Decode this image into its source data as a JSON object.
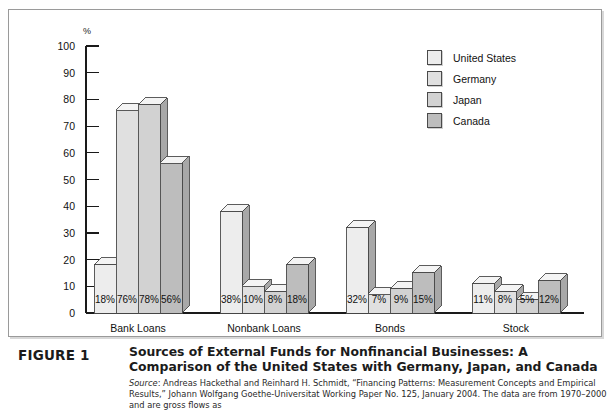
{
  "chart_data": {
    "type": "bar",
    "title": "",
    "xlabel": "",
    "ylabel": "%",
    "ylim": [
      0,
      100
    ],
    "yticks": [
      100,
      90,
      80,
      70,
      60,
      50,
      40,
      30,
      20,
      10,
      0
    ],
    "grid": false,
    "legend_position": "top-right",
    "categories": [
      "Bank Loans",
      "Nonbank Loans",
      "Bonds",
      "Stock"
    ],
    "series": [
      {
        "name": "United States",
        "color": "#ededed",
        "values": [
          18,
          38,
          32,
          11
        ],
        "labels": [
          "18%",
          "38%",
          "32%",
          "11%"
        ]
      },
      {
        "name": "Germany",
        "color": "#e0e0e0",
        "values": [
          76,
          10,
          7,
          8
        ],
        "labels": [
          "76%",
          "10%",
          "7%",
          "8%"
        ]
      },
      {
        "name": "Japan",
        "color": "#d2d2d2",
        "values": [
          78,
          8,
          9,
          5
        ],
        "labels": [
          "78%",
          "8%",
          "9%",
          "5%"
        ]
      },
      {
        "name": "Canada",
        "color": "#bdbdbd",
        "values": [
          56,
          18,
          15,
          12
        ],
        "labels": [
          "56%",
          "18%",
          "15%",
          "12%"
        ]
      }
    ]
  },
  "legend": {
    "items": [
      {
        "label": "United States"
      },
      {
        "label": "Germany"
      },
      {
        "label": "Japan"
      },
      {
        "label": "Canada"
      }
    ]
  },
  "caption": {
    "figure_label": "FIGURE 1",
    "title": "Sources of External Funds for Nonfinancial Businesses: A Comparison of the United States with Germany, Japan, and Canada",
    "source_word": "Source",
    "source_text": ": Andreas Hackethal and Reinhard H. Schmidt, “Financing Patterns: Measurement Concepts and Empirical Results,” Johann Wolfgang Goethe-Universitat Working Paper No. 125, January 2004. The data are from 1970–2000 and are gross flows as"
  },
  "colors": {
    "axis": "#1a1a1a",
    "frame": "#9a9a9a",
    "bar_outline": "#4a4a4a",
    "side_face": "#a8a8a8",
    "top_face": "#f4f4f4"
  }
}
